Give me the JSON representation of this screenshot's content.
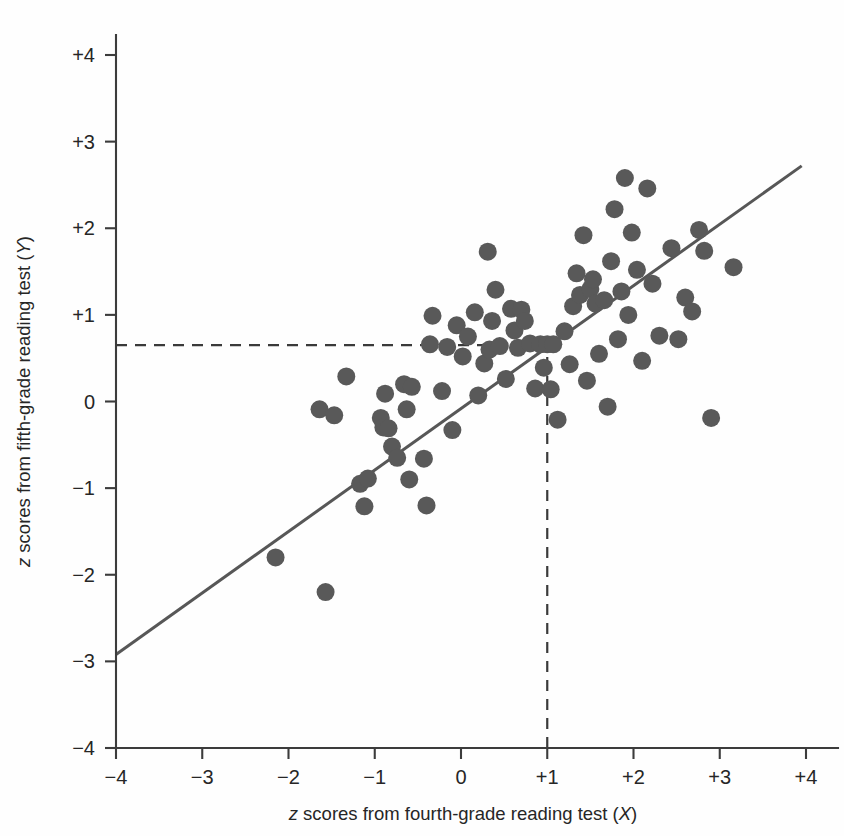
{
  "figure": {
    "background": "#fefefe",
    "point_color": "#595959",
    "line_color": "#575757",
    "axis_color": "#3c3c3c"
  },
  "axes": {
    "x_title_parts": {
      "pre": "z",
      "mid": " scores from fourth-grade reading test (",
      "var": "X",
      "post": ")"
    },
    "y_title_parts": {
      "pre": "z",
      "mid": " scores from fifth-grade reading test (",
      "var": "Y",
      "post": ")"
    },
    "x_ticks": [
      "-4",
      "-3",
      "-2",
      "-1",
      "0",
      "+1",
      "+2",
      "+3",
      "+4"
    ],
    "y_ticks": [
      "+4",
      "+3",
      "+2",
      "+1",
      "0",
      "-1",
      "-2",
      "-3",
      "-4"
    ]
  },
  "chart_data": {
    "type": "scatter",
    "title": "",
    "xlabel": "z scores from fourth-grade reading test (X)",
    "ylabel": "z scores from fifth-grade reading test (Y)",
    "xlim": [
      -4,
      4
    ],
    "ylim": [
      -4,
      4
    ],
    "xticks": [
      -4,
      -3,
      -2,
      -1,
      0,
      1,
      2,
      3,
      4
    ],
    "yticks": [
      -4,
      -3,
      -2,
      -1,
      0,
      1,
      2,
      3,
      4
    ],
    "xticklabels": [
      "-4",
      "-3",
      "-2",
      "-1",
      "0",
      "+1",
      "+2",
      "+3",
      "+4"
    ],
    "yticklabels": [
      "-4",
      "-3",
      "-2",
      "-1",
      "0",
      "+1",
      "+2",
      "+3",
      "+4"
    ],
    "grid": false,
    "legend": false,
    "marker_size": 9,
    "points": [
      [
        -2.15,
        -1.8
      ],
      [
        -1.57,
        -2.2
      ],
      [
        -1.64,
        -0.09
      ],
      [
        -1.47,
        -0.16
      ],
      [
        -1.33,
        0.29
      ],
      [
        -1.17,
        -0.95
      ],
      [
        -1.12,
        -1.21
      ],
      [
        -1.08,
        -0.89
      ],
      [
        -0.93,
        -0.19
      ],
      [
        -0.9,
        -0.3
      ],
      [
        -0.88,
        0.09
      ],
      [
        -0.84,
        -0.31
      ],
      [
        -0.8,
        -0.52
      ],
      [
        -0.74,
        -0.65
      ],
      [
        -0.66,
        0.2
      ],
      [
        -0.63,
        -0.09
      ],
      [
        -0.6,
        -0.9
      ],
      [
        -0.57,
        0.17
      ],
      [
        -0.43,
        -0.66
      ],
      [
        -0.4,
        -1.2
      ],
      [
        -0.36,
        0.66
      ],
      [
        -0.33,
        0.99
      ],
      [
        -0.22,
        0.12
      ],
      [
        -0.16,
        0.63
      ],
      [
        -0.1,
        -0.33
      ],
      [
        -0.05,
        0.88
      ],
      [
        0.02,
        0.52
      ],
      [
        0.08,
        0.75
      ],
      [
        0.16,
        1.03
      ],
      [
        0.2,
        0.07
      ],
      [
        0.27,
        0.44
      ],
      [
        0.31,
        1.73
      ],
      [
        0.33,
        0.6
      ],
      [
        0.36,
        0.93
      ],
      [
        0.4,
        1.29
      ],
      [
        0.45,
        0.64
      ],
      [
        0.52,
        0.26
      ],
      [
        0.58,
        1.07
      ],
      [
        0.62,
        0.82
      ],
      [
        0.66,
        0.62
      ],
      [
        0.7,
        1.06
      ],
      [
        0.74,
        0.93
      ],
      [
        0.8,
        0.67
      ],
      [
        0.86,
        0.15
      ],
      [
        0.92,
        0.66
      ],
      [
        0.96,
        0.39
      ],
      [
        1.0,
        0.66
      ],
      [
        1.04,
        0.14
      ],
      [
        1.07,
        0.66
      ],
      [
        1.12,
        -0.21
      ],
      [
        1.2,
        0.81
      ],
      [
        1.26,
        0.43
      ],
      [
        1.3,
        1.1
      ],
      [
        1.34,
        1.48
      ],
      [
        1.38,
        1.23
      ],
      [
        1.42,
        1.92
      ],
      [
        1.46,
        0.24
      ],
      [
        1.5,
        1.3
      ],
      [
        1.53,
        1.41
      ],
      [
        1.56,
        1.13
      ],
      [
        1.6,
        0.55
      ],
      [
        1.66,
        1.17
      ],
      [
        1.7,
        -0.06
      ],
      [
        1.74,
        1.62
      ],
      [
        1.78,
        2.22
      ],
      [
        1.82,
        0.72
      ],
      [
        1.86,
        1.27
      ],
      [
        1.9,
        2.58
      ],
      [
        1.94,
        1.0
      ],
      [
        1.98,
        1.95
      ],
      [
        2.04,
        1.52
      ],
      [
        2.1,
        0.47
      ],
      [
        2.16,
        2.46
      ],
      [
        2.22,
        1.36
      ],
      [
        2.3,
        0.76
      ],
      [
        2.44,
        1.77
      ],
      [
        2.52,
        0.72
      ],
      [
        2.6,
        1.2
      ],
      [
        2.68,
        1.04
      ],
      [
        2.76,
        1.98
      ],
      [
        2.82,
        1.74
      ],
      [
        2.9,
        -0.19
      ],
      [
        3.16,
        1.55
      ]
    ],
    "regression_line": {
      "x_start": -4.0,
      "y_start": -2.92,
      "x_end": 3.95,
      "y_end": 2.72,
      "slope": 0.71,
      "intercept": -0.08
    },
    "guides": [
      {
        "kind": "horizontal",
        "y": 0.65,
        "x_from": -4.0,
        "x_to": 1.0
      },
      {
        "kind": "vertical",
        "x": 1.0,
        "y_from": -4.0,
        "y_to": 0.65
      }
    ]
  }
}
